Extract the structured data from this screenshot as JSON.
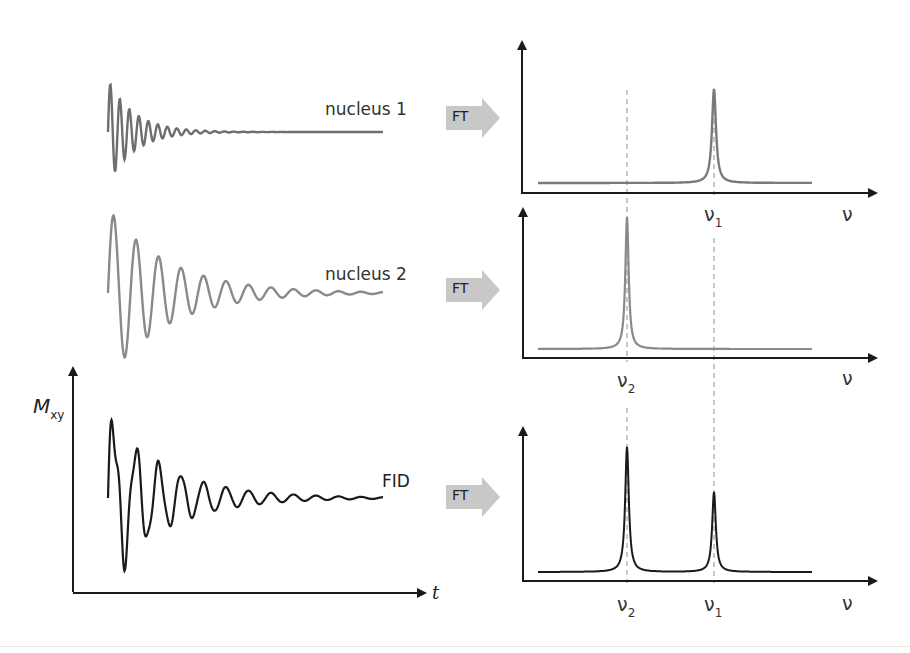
{
  "chart_data": {
    "type": "diagram",
    "title": "",
    "time_domain": [
      {
        "name": "nucleus 1",
        "label": "nucleus 1",
        "color": "#6e6e6e",
        "frequency": "high",
        "decay": "fast"
      },
      {
        "name": "nucleus 2",
        "label": "nucleus 2",
        "color": "#8a8a8a",
        "frequency": "low",
        "decay": "slow"
      },
      {
        "name": "FID",
        "label": "FID",
        "color": "#1a1a1a",
        "composition": "sum of nucleus 1 and nucleus 2"
      }
    ],
    "transform_label": "FT",
    "frequency_domain": [
      {
        "name": "spectrum nucleus 1",
        "peaks": [
          {
            "label": "ν1",
            "position": "right",
            "relative_height": 0.62
          }
        ],
        "color": "#7a7a7a"
      },
      {
        "name": "spectrum nucleus 2",
        "peaks": [
          {
            "label": "ν2",
            "position": "left",
            "relative_height": 0.92
          }
        ],
        "color": "#8a8a8a"
      },
      {
        "name": "spectrum FID",
        "peaks": [
          {
            "label": "ν2",
            "position": "left",
            "relative_height": 0.85
          },
          {
            "label": "ν1",
            "position": "right",
            "relative_height": 0.54
          }
        ],
        "color": "#1a1a1a"
      }
    ],
    "axes": {
      "time_ylabel": "M",
      "time_ylabel_sub": "xy",
      "time_xlabel": "t",
      "freq_xlabel": "ν"
    }
  },
  "labels": {
    "nucleus1": "nucleus 1",
    "nucleus2": "nucleus 2",
    "fid": "FID",
    "ft": "FT",
    "mxy_main": "M",
    "mxy_sub": "xy",
    "t": "t",
    "nu": "ν",
    "nu1_main": "ν",
    "nu1_sub": "1",
    "nu2_main": "ν",
    "nu2_sub": "2"
  },
  "colors": {
    "nucleus1": "#6e6e6e",
    "nucleus2": "#8a8a8a",
    "fid": "#1a1a1a",
    "axis": "#1a1a1a",
    "dashed": "#aaaaaa",
    "ft_arrow": "#c8c8c8"
  }
}
